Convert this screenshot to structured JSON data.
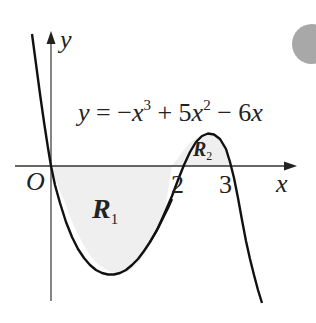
{
  "figure": {
    "equation": {
      "lhs": "y",
      "eq": " = −",
      "x1": "x",
      "sup1": "3",
      "plus": " + 5",
      "x2": "x",
      "sup2": "2",
      "minus": " − 6",
      "x3": "x"
    },
    "axes": {
      "x_label": "x",
      "y_label": "y",
      "origin_label": "O",
      "tick_2": "2",
      "tick_3": "3"
    },
    "regions": {
      "r1_letter": "R",
      "r1_sub": "1",
      "r2_letter": "R",
      "r2_sub": "2"
    },
    "colors": {
      "curve": "#111111",
      "axis": "#333333",
      "shade": "#efefef",
      "circle": "#a8a8a8"
    }
  }
}
